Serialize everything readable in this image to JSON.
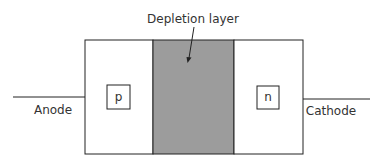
{
  "diagram": {
    "labels": {
      "depletion": "Depletion layer",
      "p_region": "p",
      "n_region": "n",
      "anode": "Anode",
      "cathode": "Cathode"
    },
    "colors": {
      "outline": "#222222",
      "depletion_fill": "#9c9c9c",
      "background": "#ffffff"
    }
  }
}
